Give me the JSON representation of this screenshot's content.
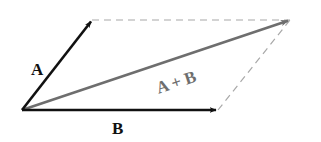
{
  "diagram": {
    "type": "vector-addition-parallelogram",
    "colors": {
      "vector": "#111111",
      "resultant": "#6e6e6e",
      "dashed": "#a8a8a8",
      "background": "#ffffff"
    },
    "vectors": [
      {
        "id": "A",
        "label": "A",
        "from": [
          22,
          110
        ],
        "to": [
          92,
          20
        ]
      },
      {
        "id": "B",
        "label": "B",
        "from": [
          22,
          110
        ],
        "to": [
          218,
          110
        ]
      },
      {
        "id": "resultant",
        "label": "A+B",
        "from": [
          22,
          110
        ],
        "to": [
          290,
          20
        ]
      }
    ],
    "dashed_edges": [
      {
        "from": [
          92,
          20
        ],
        "to": [
          290,
          20
        ]
      },
      {
        "from": [
          218,
          110
        ],
        "to": [
          290,
          20
        ]
      }
    ],
    "labels": {
      "a": "A",
      "b": "B",
      "sum": "A + B"
    }
  }
}
